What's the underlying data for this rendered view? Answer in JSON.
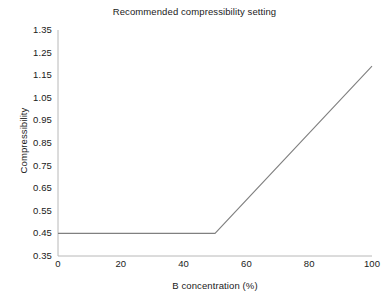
{
  "chart_data": {
    "type": "line",
    "title": "Recommended compressibility setting",
    "xlabel": "B concentration (%)",
    "ylabel": "Compressibility",
    "xlim": [
      0,
      100
    ],
    "ylim": [
      0.35,
      1.35
    ],
    "grid": false,
    "legend": null,
    "xticks": [
      0,
      20,
      40,
      60,
      80,
      100
    ],
    "xtick_labels": [
      "0",
      "20",
      "40",
      "60",
      "80",
      "100"
    ],
    "yticks": [
      0.35,
      0.45,
      0.55,
      0.65,
      0.75,
      0.85,
      0.95,
      1.05,
      1.15,
      1.25,
      1.35
    ],
    "ytick_labels": [
      "0.35",
      "0.45",
      "0.55",
      "0.65",
      "0.75",
      "0.85",
      "0.95",
      "1.05",
      "1.15",
      "1.25",
      "1.35"
    ],
    "series": [
      {
        "name": "Recommended compressibility",
        "color": "#808080",
        "x": [
          0,
          50,
          100
        ],
        "values": [
          0.45,
          0.45,
          1.19
        ]
      }
    ],
    "annotations": []
  },
  "style": {
    "line_color": "#808080",
    "axis_color": "#b0b0b0",
    "text_color": "#1a1a1a",
    "background": "#ffffff"
  }
}
